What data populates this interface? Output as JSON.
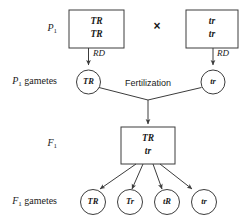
{
  "diagram": {
    "cross_symbol": "×",
    "fertilization_label": "Fertilization",
    "line_color": "#3c3c3c",
    "text_color": "#1a1a1a",
    "background": "#ffffff"
  },
  "row_labels": {
    "p1": {
      "base": "P",
      "sub": "1",
      "suffix": ""
    },
    "p1_gametes": {
      "base": "P",
      "sub": "1",
      "suffix": " gametes"
    },
    "f1": {
      "base": "F",
      "sub": "1",
      "suffix": ""
    },
    "f1_gametes": {
      "base": "F",
      "sub": "1",
      "suffix": " gametes"
    }
  },
  "parents": [
    {
      "name": "parent-left",
      "line1": "TR",
      "line2": "TR",
      "arrow_label": "RD"
    },
    {
      "name": "parent-right",
      "line1": "tr",
      "line2": "tr",
      "arrow_label": "RD"
    }
  ],
  "p1_gametes": [
    {
      "name": "p1-gamete-left",
      "label": "TR"
    },
    {
      "name": "p1-gamete-right",
      "label": "tr"
    }
  ],
  "f1": {
    "line1": "TR",
    "line2": "tr"
  },
  "f1_gametes": [
    {
      "name": "f1-gamete-1",
      "label": "TR"
    },
    {
      "name": "f1-gamete-2",
      "label": "Tr"
    },
    {
      "name": "f1-gamete-3",
      "label": "tR"
    },
    {
      "name": "f1-gamete-4",
      "label": "tr"
    }
  ]
}
